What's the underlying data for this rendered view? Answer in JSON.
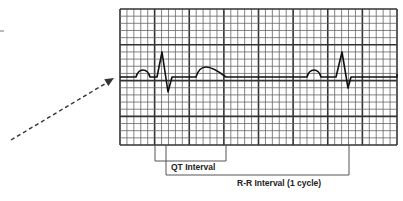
{
  "diagram": {
    "colors": {
      "grid_minor": "#666666",
      "grid_major": "#333333",
      "trace": "#111111",
      "arrow": "#333333",
      "bracket": "#555555"
    },
    "grid": {
      "x": 120,
      "y": 9,
      "width": 277,
      "height": 136,
      "small_box": 7,
      "major_every": 5
    },
    "baseline_y": 77,
    "labels": {
      "qt_interval": "QT Interval",
      "rr_interval": "R-R Interval (1 cycle)"
    },
    "brackets": {
      "qt": {
        "x1": 155,
        "x2": 226,
        "y_top": 145,
        "y_bottom": 161
      },
      "rr": {
        "x1": 166,
        "x2": 349,
        "y_top": 145,
        "y_bottom": 175
      }
    },
    "pointer_arrow": {
      "x1": 11,
      "y1": 140,
      "x2": 114,
      "y2": 78,
      "style": "dashed"
    }
  }
}
